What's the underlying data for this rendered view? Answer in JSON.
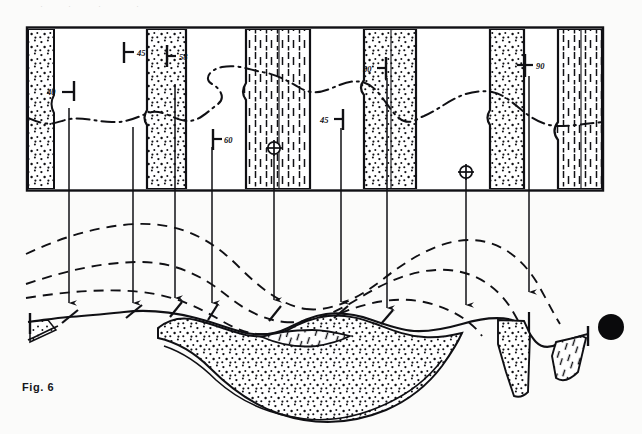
{
  "figure": {
    "caption": "Fig. 6",
    "title_fragment": "",
    "page_bg": "#fbfbfa",
    "ink": "#101014"
  },
  "map_panel": {
    "name": "geologic-map-panel",
    "frame": {
      "x": 26,
      "y": 27,
      "w": 578,
      "h": 164
    },
    "units": [
      {
        "id": "u1",
        "pattern": "stipple",
        "x0": 28,
        "x1": 57
      },
      {
        "id": "u2",
        "pattern": "blank",
        "x0": 57,
        "x1": 147
      },
      {
        "id": "u3",
        "pattern": "stipple",
        "x0": 147,
        "x1": 186
      },
      {
        "id": "u4",
        "pattern": "blank",
        "x0": 186,
        "x1": 244
      },
      {
        "id": "u5",
        "pattern": "dash",
        "x0": 244,
        "x1": 310
      },
      {
        "id": "u6",
        "pattern": "blank",
        "x0": 310,
        "x1": 364
      },
      {
        "id": "u7",
        "pattern": "stipple",
        "x0": 364,
        "x1": 416
      },
      {
        "id": "u8",
        "pattern": "blank",
        "x0": 416,
        "x1": 490
      },
      {
        "id": "u9",
        "pattern": "stipple",
        "x0": 490,
        "x1": 524
      },
      {
        "id": "u10",
        "pattern": "blank",
        "x0": 524,
        "x1": 556
      },
      {
        "id": "u11",
        "pattern": "dash",
        "x0": 556,
        "x1": 602
      }
    ],
    "strike_dip_symbols": [
      {
        "id": "sd-40",
        "label": "40",
        "x": 62,
        "y": 92,
        "label_side": "left",
        "vertical": false
      },
      {
        "id": "sd-45",
        "label": "45",
        "x": 124,
        "y": 52,
        "label_side": "right",
        "vertical": false
      },
      {
        "id": "sd-58",
        "label": "58",
        "x": 167,
        "y": 56,
        "label_side": "right",
        "vertical": false
      },
      {
        "id": "sd-60",
        "label": "60",
        "x": 213,
        "y": 139,
        "label_side": "right",
        "vertical": false
      },
      {
        "id": "sd-45b",
        "label": "45",
        "x": 343,
        "y": 119,
        "label_side": "left",
        "vertical": false
      },
      {
        "id": "sd-50",
        "label": "50",
        "x": 383,
        "y": 68,
        "label_side": "left",
        "vertical": false
      },
      {
        "id": "sd-90",
        "label": "90",
        "x": 525,
        "y": 65,
        "label_side": "right",
        "vertical": true
      }
    ],
    "fold_axis_symbols": [
      {
        "id": "axis-anticline",
        "x": 274,
        "y": 148
      },
      {
        "id": "axis-syncline",
        "x": 466,
        "y": 172
      }
    ],
    "contact_trace_name": "dash-dot-contact-line"
  },
  "correlation_arrows": [
    {
      "id": "arrow-1",
      "x_top": 69,
      "y_top": 108,
      "x_bot": 69,
      "y_bot": 303
    },
    {
      "id": "arrow-2",
      "x_top": 133,
      "y_top": 127,
      "x_bot": 133,
      "y_bot": 303
    },
    {
      "id": "arrow-3",
      "x_top": 175,
      "y_top": 84,
      "x_bot": 175,
      "y_bot": 298
    },
    {
      "id": "arrow-4",
      "x_top": 212,
      "y_top": 147,
      "x_bot": 212,
      "y_bot": 303
    },
    {
      "id": "arrow-5",
      "x_top": 274,
      "y_top": 155,
      "x_bot": 274,
      "y_bot": 300
    },
    {
      "id": "arrow-6",
      "x_top": 341,
      "y_top": 128,
      "x_bot": 341,
      "y_bot": 302
    },
    {
      "id": "arrow-7",
      "x_top": 387,
      "y_top": 78,
      "x_bot": 387,
      "y_bot": 308
    },
    {
      "id": "arrow-8",
      "x_top": 466,
      "y_top": 178,
      "x_bot": 466,
      "y_bot": 305
    },
    {
      "id": "arrow-9",
      "x_top": 529,
      "y_top": 76,
      "x_bot": 529,
      "y_bot": 292
    }
  ],
  "section_panel": {
    "name": "cross-section-panel",
    "ground_surface_name": "topographic-surface-line",
    "projected_beds": [
      {
        "id": "eroded-bed-outer",
        "style": "dashed"
      },
      {
        "id": "eroded-bed-middle",
        "style": "dashed"
      },
      {
        "id": "eroded-bed-inner",
        "style": "dashed"
      }
    ],
    "bed_units": [
      {
        "id": "sec-stipple-syncline",
        "pattern": "stipple"
      },
      {
        "id": "sec-dash-keel",
        "pattern": "dash"
      },
      {
        "id": "sec-stipple-right",
        "pattern": "stipple"
      },
      {
        "id": "sec-dash-right",
        "pattern": "dash"
      },
      {
        "id": "sec-stipple-left-end",
        "pattern": "stipple"
      }
    ],
    "dip_ticks": [
      {
        "id": "sec-tick-1",
        "x": 69,
        "y": 316
      },
      {
        "id": "sec-tick-2",
        "x": 133,
        "y": 311
      },
      {
        "id": "sec-tick-3",
        "x": 175,
        "y": 310
      },
      {
        "id": "sec-tick-4",
        "x": 212,
        "y": 312
      },
      {
        "id": "sec-tick-5",
        "x": 274,
        "y": 312
      },
      {
        "id": "sec-tick-6",
        "x": 341,
        "y": 311
      },
      {
        "id": "sec-tick-7",
        "x": 387,
        "y": 316
      },
      {
        "id": "sec-tick-8",
        "x": 529,
        "y": 317
      }
    ]
  },
  "page_marker": {
    "name": "black-dot-marker",
    "cx": 611,
    "cy": 327,
    "r": 13
  }
}
